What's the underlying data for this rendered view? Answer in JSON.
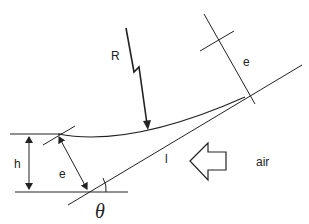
{
  "diagram": {
    "labels": {
      "R": "R",
      "e_top": "e",
      "e_left": "e",
      "h": "h",
      "l": "l",
      "air": "air",
      "theta": "θ"
    },
    "colors": {
      "stroke": "#222222",
      "background": "#ffffff"
    }
  }
}
